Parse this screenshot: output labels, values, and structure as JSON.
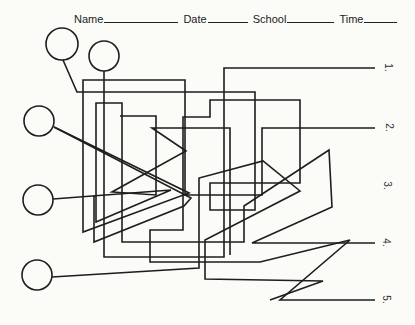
{
  "header": {
    "fields": [
      {
        "label": "Name",
        "blank_width": 74
      },
      {
        "label": "Date",
        "blank_width": 40
      },
      {
        "label": "School",
        "blank_width": 47
      },
      {
        "label": "Time",
        "blank_width": 33
      }
    ]
  },
  "maze": {
    "start_circles": [
      {
        "id": 1,
        "cx": 62,
        "cy": 44,
        "r": 16
      },
      {
        "id": 2,
        "cx": 104,
        "cy": 56,
        "r": 15
      },
      {
        "id": 3,
        "cx": 39,
        "cy": 121,
        "r": 15
      },
      {
        "id": 4,
        "cx": 38,
        "cy": 200,
        "r": 15
      },
      {
        "id": 5,
        "cx": 37,
        "cy": 275,
        "r": 15
      }
    ],
    "end_labels": [
      {
        "text": "1.",
        "x": 386,
        "y": 68
      },
      {
        "text": "2.",
        "x": 387,
        "y": 128
      },
      {
        "text": "3.",
        "x": 385,
        "y": 186
      },
      {
        "text": "4.",
        "x": 384,
        "y": 243
      },
      {
        "text": "5.",
        "x": 384,
        "y": 300
      }
    ],
    "line_color": "#1e1e1e"
  }
}
